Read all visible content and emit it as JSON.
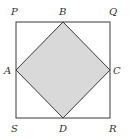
{
  "diagram": {
    "colors": {
      "stroke": "#3a3a3a",
      "fill": "#d9d9d9",
      "label": "#333333",
      "background": "#ffffff"
    },
    "outer_square": {
      "vertices": [
        "P",
        "Q",
        "R",
        "S"
      ]
    },
    "inner_square": {
      "vertices": [
        "A",
        "B",
        "C",
        "D"
      ],
      "shaded": true
    },
    "labels": {
      "P": "P",
      "Q": "Q",
      "R": "R",
      "S": "S",
      "A": "A",
      "B": "B",
      "C": "C",
      "D": "D"
    }
  }
}
